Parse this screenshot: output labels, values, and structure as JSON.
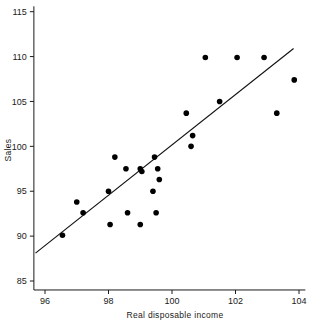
{
  "chart_data": {
    "type": "scatter",
    "title": "",
    "subtitle": "",
    "xlabel": "Real disposable income",
    "ylabel": "Sales",
    "xlim": [
      95.65,
      104.2
    ],
    "ylim": [
      84.0,
      115.6
    ],
    "xticks": [
      96,
      98,
      100,
      102,
      104
    ],
    "xtick_labels": [
      "96",
      "98",
      "100",
      "102",
      "104"
    ],
    "yticks": [
      85,
      90,
      95,
      100,
      105,
      110,
      115
    ],
    "ytick_labels": [
      "85",
      "90",
      "95",
      "100",
      "105",
      "110",
      "115"
    ],
    "grid": false,
    "legend": null,
    "marker": {
      "shape": "circle",
      "color": "#000000",
      "size_px": 5.6
    },
    "x": [
      96.55,
      97.0,
      97.2,
      98.0,
      98.05,
      98.2,
      98.55,
      98.6,
      99.0,
      99.0,
      99.05,
      99.4,
      99.45,
      99.5,
      99.55,
      99.6,
      100.45,
      100.6,
      100.65,
      101.05,
      101.5,
      102.05,
      102.9,
      103.3,
      103.85
    ],
    "y": [
      90.1,
      93.8,
      92.6,
      95.0,
      91.3,
      98.8,
      97.5,
      92.6,
      97.5,
      91.3,
      97.2,
      95.0,
      98.8,
      92.6,
      97.5,
      96.3,
      103.7,
      100.0,
      101.2,
      109.9,
      105.0,
      109.9,
      109.9,
      103.7,
      107.4
    ],
    "points": [
      {
        "x": 96.55,
        "y": 90.1
      },
      {
        "x": 97.0,
        "y": 93.8
      },
      {
        "x": 97.2,
        "y": 92.6
      },
      {
        "x": 98.0,
        "y": 95.0
      },
      {
        "x": 98.05,
        "y": 91.3
      },
      {
        "x": 98.2,
        "y": 98.8
      },
      {
        "x": 98.55,
        "y": 97.5
      },
      {
        "x": 98.6,
        "y": 92.6
      },
      {
        "x": 99.0,
        "y": 97.5
      },
      {
        "x": 99.0,
        "y": 91.3
      },
      {
        "x": 99.05,
        "y": 97.2
      },
      {
        "x": 99.4,
        "y": 95.0
      },
      {
        "x": 99.45,
        "y": 98.8
      },
      {
        "x": 99.5,
        "y": 92.6
      },
      {
        "x": 99.55,
        "y": 97.5
      },
      {
        "x": 99.6,
        "y": 96.3
      },
      {
        "x": 100.45,
        "y": 103.7
      },
      {
        "x": 100.6,
        "y": 100.0
      },
      {
        "x": 100.65,
        "y": 101.2
      },
      {
        "x": 101.05,
        "y": 109.9
      },
      {
        "x": 101.5,
        "y": 105.0
      },
      {
        "x": 102.05,
        "y": 109.9
      },
      {
        "x": 102.9,
        "y": 109.9
      },
      {
        "x": 103.3,
        "y": 103.7
      },
      {
        "x": 103.85,
        "y": 107.4
      }
    ],
    "fit_line": {
      "type": "linear-regression",
      "x_start": 95.7,
      "y_start": 88.1,
      "x_end": 103.83,
      "y_end": 110.9,
      "color": "#111111"
    }
  }
}
